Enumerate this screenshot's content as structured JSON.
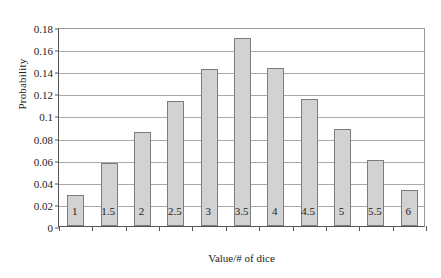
{
  "chart_data": {
    "type": "bar",
    "title": "",
    "xlabel": "Value/# of dice",
    "ylabel": "Probability",
    "categories": [
      "1",
      "1.5",
      "2",
      "2.5",
      "3",
      "3.5",
      "4",
      "4.5",
      "5",
      "5.5",
      "6"
    ],
    "values": [
      0.028,
      0.057,
      0.085,
      0.113,
      0.142,
      0.17,
      0.143,
      0.115,
      0.088,
      0.06,
      0.033
    ],
    "ylim": [
      0,
      0.18
    ],
    "y_ticks": [
      0,
      0.02,
      0.04,
      0.06,
      0.08,
      0.1,
      0.12,
      0.14,
      0.16,
      0.18
    ],
    "y_tick_labels": [
      "0",
      "0.02",
      "0.04",
      "0.06",
      "0.08",
      "0.1",
      "0.12",
      "0.14",
      "0.16",
      "0.18"
    ],
    "grid": "horizontal",
    "legend": "none",
    "bar_color": "#d2d2d2",
    "bar_border_color": "#7d7d7d",
    "gridline_color": "#a9a9a9",
    "axis_color": "#555555"
  }
}
